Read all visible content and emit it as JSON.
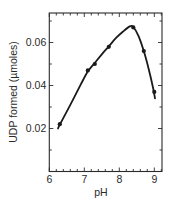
{
  "chart_data": {
    "type": "line",
    "title": "",
    "xlabel": "pH",
    "ylabel": "UDP formed (µmoles)",
    "xlim": [
      6,
      9.25
    ],
    "ylim": [
      0,
      0.074
    ],
    "x_ticks": [
      6,
      7,
      8,
      9
    ],
    "x_tick_labels": [
      "6",
      "7",
      "8",
      "9"
    ],
    "x_minor_step": 0.2,
    "y_ticks": [
      0.02,
      0.04,
      0.06
    ],
    "y_tick_labels": [
      "0.02",
      "0.04",
      "0.06"
    ],
    "y_minor_step": 0.01,
    "grid": false,
    "legend": null,
    "series": [
      {
        "name": "UDP formed",
        "marker": "circle",
        "color": "#1a1a1a",
        "x": [
          6.3,
          7.1,
          7.3,
          7.7,
          8.4,
          8.7,
          9.0
        ],
        "values": [
          0.022,
          0.047,
          0.05,
          0.058,
          0.067,
          0.056,
          0.037
        ]
      }
    ],
    "fitted_curve": {
      "x": [
        6.25,
        6.3,
        6.6,
        6.9,
        7.1,
        7.3,
        7.5,
        7.7,
        7.9,
        8.1,
        8.3,
        8.4,
        8.55,
        8.7,
        8.85,
        8.97,
        9.02
      ],
      "values": [
        0.02,
        0.0218,
        0.031,
        0.0405,
        0.0465,
        0.0505,
        0.0545,
        0.0582,
        0.062,
        0.065,
        0.0675,
        0.0672,
        0.063,
        0.056,
        0.047,
        0.0385,
        0.034
      ]
    }
  }
}
